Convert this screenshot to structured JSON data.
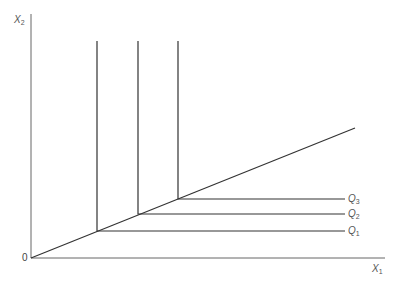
{
  "diagram": {
    "type": "isoquant-map-leontief",
    "axes": {
      "x_label": {
        "main": "X",
        "sub": "1"
      },
      "y_label": {
        "main": "X",
        "sub": "2"
      },
      "origin_label": "0"
    },
    "expansion_path": {
      "from": [
        31,
        258
      ],
      "to": [
        355,
        128
      ]
    },
    "isoquants": [
      {
        "main": "Q",
        "sub": "1",
        "corner": [
          97,
          231
        ],
        "top_y": 41,
        "right_x": 345
      },
      {
        "main": "Q",
        "sub": "2",
        "corner": [
          138,
          214
        ],
        "top_y": 41,
        "right_x": 345
      },
      {
        "main": "Q",
        "sub": "3",
        "corner": [
          178,
          199
        ],
        "top_y": 41,
        "right_x": 345
      }
    ],
    "colors": {
      "axis": "#555555",
      "line": "#333333",
      "label": "#555555"
    }
  }
}
